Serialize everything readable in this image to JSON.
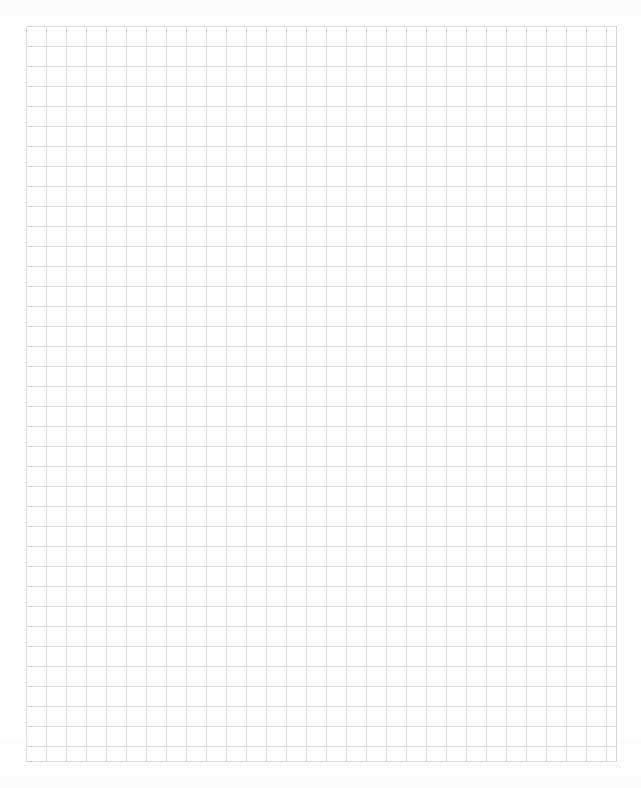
{
  "document": {
    "title": "Graph Paper Sheet",
    "kind": "graph-paper",
    "page_width_px": 641,
    "page_height_px": 788,
    "background_color": "#ffffff"
  },
  "grid": {
    "label": "Square ruled grid",
    "origin_x_px": 26,
    "origin_y_px": 26,
    "end_x_px": 617,
    "end_y_px": 762,
    "width_px": 591,
    "height_px": 736,
    "cell_size_px": 20,
    "columns": 30,
    "rows": 37,
    "line_color": "#dfe0e1",
    "line_width_px": 1,
    "edge_line_color": "#d8d9da",
    "has_major_lines": false,
    "has_labels": false,
    "has_axis_numbers": false
  },
  "margins": {
    "left_px": 26,
    "top_px": 26,
    "right_px": 24,
    "bottom_px": 26,
    "color": "#ffffff"
  },
  "content": {
    "marks": [],
    "annotations": [],
    "text": ""
  }
}
